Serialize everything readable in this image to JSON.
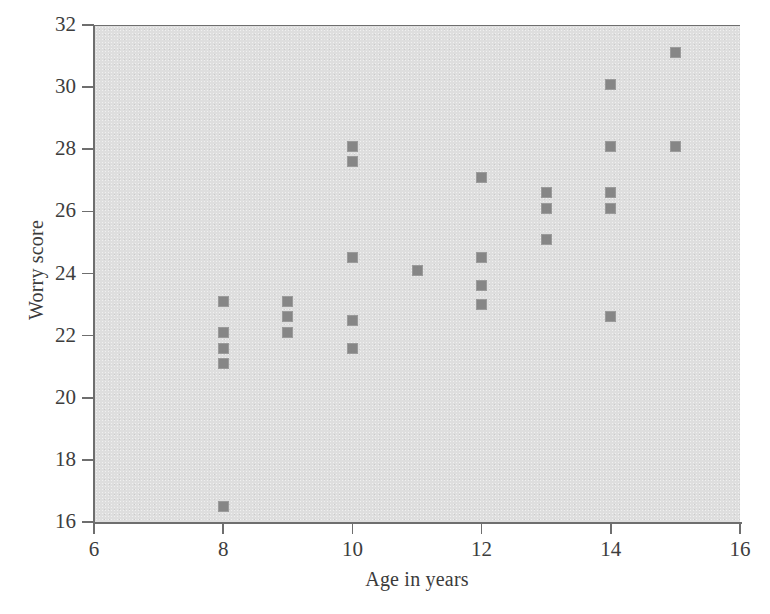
{
  "chart_data": {
    "type": "scatter",
    "title": "",
    "xlabel": "Age in years",
    "ylabel": "Worry score",
    "xlim": [
      6,
      16
    ],
    "ylim": [
      16,
      32
    ],
    "xticks": [
      6,
      8,
      10,
      12,
      14,
      16
    ],
    "yticks": [
      16,
      18,
      20,
      22,
      24,
      26,
      28,
      30,
      32
    ],
    "grid": false,
    "legend": null,
    "marker": "square",
    "marker_color": "#868686",
    "plot_background": "#dedede",
    "axis_color": "#6e6e6e",
    "points": [
      {
        "x": 8,
        "y": 23.1
      },
      {
        "x": 8,
        "y": 22.1
      },
      {
        "x": 8,
        "y": 21.6
      },
      {
        "x": 8,
        "y": 21.1
      },
      {
        "x": 8,
        "y": 16.5
      },
      {
        "x": 9,
        "y": 23.1
      },
      {
        "x": 9,
        "y": 22.6
      },
      {
        "x": 9,
        "y": 22.1
      },
      {
        "x": 10,
        "y": 28.1
      },
      {
        "x": 10,
        "y": 27.6
      },
      {
        "x": 10,
        "y": 24.5
      },
      {
        "x": 10,
        "y": 22.5
      },
      {
        "x": 10,
        "y": 21.6
      },
      {
        "x": 11,
        "y": 24.1
      },
      {
        "x": 12,
        "y": 27.1
      },
      {
        "x": 12,
        "y": 24.5
      },
      {
        "x": 12,
        "y": 23.6
      },
      {
        "x": 12,
        "y": 23.0
      },
      {
        "x": 13,
        "y": 26.6
      },
      {
        "x": 13,
        "y": 26.1
      },
      {
        "x": 13,
        "y": 25.1
      },
      {
        "x": 14,
        "y": 30.1
      },
      {
        "x": 14,
        "y": 28.1
      },
      {
        "x": 14,
        "y": 26.6
      },
      {
        "x": 14,
        "y": 26.1
      },
      {
        "x": 14,
        "y": 22.6
      },
      {
        "x": 15,
        "y": 31.1
      },
      {
        "x": 15,
        "y": 28.1
      }
    ]
  }
}
